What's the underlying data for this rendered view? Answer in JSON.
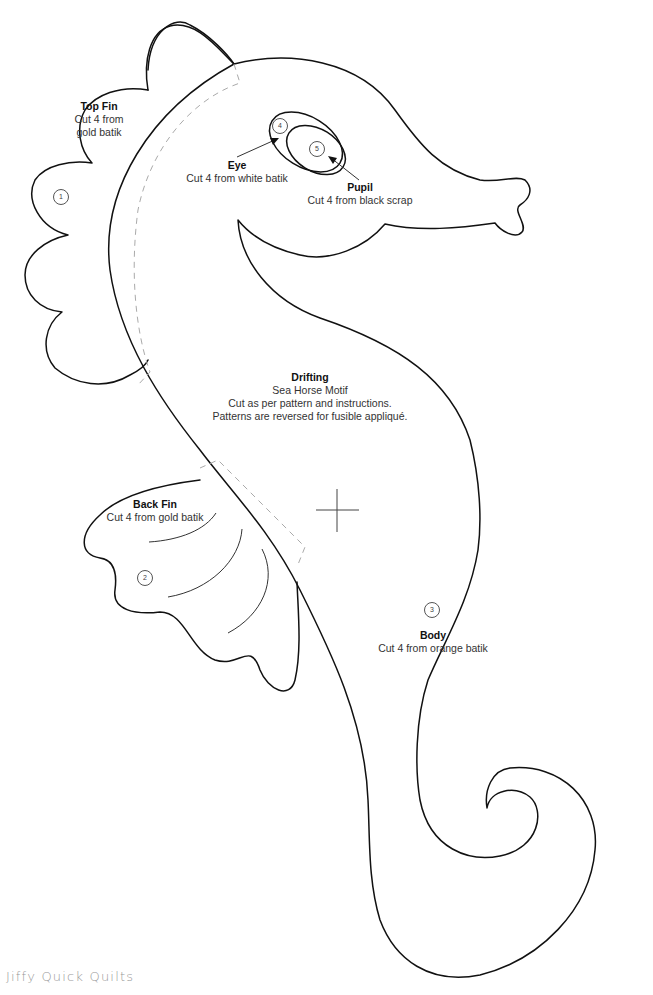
{
  "pieces": {
    "top_fin": {
      "title": "Top Fin",
      "lines": [
        "Cut 4 from",
        "gold batik"
      ],
      "number": "1"
    },
    "back_fin": {
      "title": "Back Fin",
      "lines": [
        "Cut 4 from gold batik"
      ],
      "number": "2"
    },
    "body": {
      "title": "Body",
      "lines": [
        "Cut 4 from orange batik"
      ],
      "number": "3"
    },
    "eye": {
      "title": "Eye",
      "lines": [
        "Cut 4 from white batik"
      ],
      "number": "4"
    },
    "pupil": {
      "title": "Pupil",
      "lines": [
        "Cut 4 from black scrap"
      ],
      "number": "5"
    }
  },
  "motif": {
    "title": "Drifting",
    "lines": [
      "Sea Horse Motif",
      "Cut as per pattern and instructions.",
      "Patterns are reversed for fusible appliqué."
    ]
  },
  "footer": {
    "brand": "Jiffy Quick Quilts"
  },
  "colors": {
    "outline": "#111111",
    "dashed_guide": "#aaaaaa",
    "brand_text": "#999999",
    "background": "#ffffff"
  }
}
